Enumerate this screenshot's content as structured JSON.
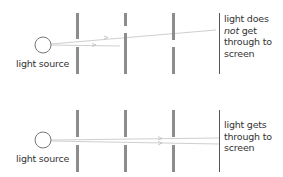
{
  "colors": {
    "barrier": "#8c8c8c",
    "ray": "#c9c9c9",
    "screen": "#555555",
    "source_outline": "#777777",
    "text": "#333333"
  },
  "top_panel": {
    "source_label": "light source",
    "screen_label": {
      "line1": "light does",
      "line2_em": "not",
      "line2_rest": " get",
      "line3": "through to",
      "line4": "screen"
    },
    "description": "Holes in barriers not aligned"
  },
  "bottom_panel": {
    "source_label": "light source",
    "screen_label": {
      "line1": "light gets",
      "line2": "through to",
      "line3": "screen"
    },
    "description": "Holes in barriers aligned"
  }
}
